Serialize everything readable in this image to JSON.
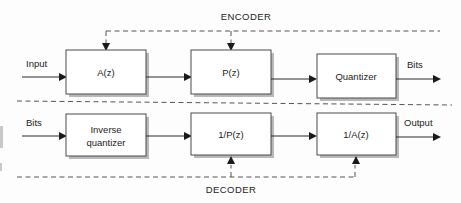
{
  "diagram": {
    "sections": [
      {
        "id": "encoder",
        "label": "ENCODER"
      },
      {
        "id": "decoder",
        "label": "DECODER"
      }
    ],
    "encoder": {
      "label": "ENCODER",
      "blocks": [
        {
          "id": "a-z",
          "label": "A(z)"
        },
        {
          "id": "p-z",
          "label": "P(z)"
        },
        {
          "id": "quantizer",
          "label": "Quantizer"
        }
      ],
      "signals": [
        {
          "id": "input",
          "label": "Input"
        },
        {
          "id": "bits-out",
          "label": "Bits"
        }
      ]
    },
    "decoder": {
      "label": "DECODER",
      "blocks": [
        {
          "id": "inverse-quantizer",
          "label_line1": "Inverse",
          "label_line2": "quantizer"
        },
        {
          "id": "inv-p-z",
          "label": "1/P(z)"
        },
        {
          "id": "inv-a-z",
          "label": "1/A(z)"
        }
      ],
      "signals": [
        {
          "id": "bits-in",
          "label": "Bits"
        },
        {
          "id": "output",
          "label": "Output"
        }
      ]
    },
    "colors": {
      "background": "#fdfdfd",
      "box_stroke": "#4a4a4a",
      "box_fill": "#ffffff",
      "solid_line": "#2a2a2a",
      "dashed_line": "#555555",
      "text": "#1c1c1c",
      "shadow": "#b9b9b9"
    }
  }
}
